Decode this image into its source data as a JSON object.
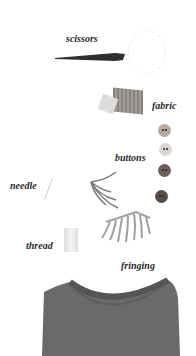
{
  "labels": {
    "scissors": "scissors",
    "fabric": "fabric",
    "buttons": "buttons",
    "needle": "needle",
    "thread": "thread",
    "fringing": "fringing"
  },
  "buttons": [
    {
      "color": "#b8a89e"
    },
    {
      "color": "#ddd6d0"
    },
    {
      "color": "#6e5f5a"
    },
    {
      "color": "#5a4d48"
    }
  ],
  "colors": {
    "tshirt": "#6a6a6a",
    "scissors_blade": "#2e2e2e",
    "fabric": "#8a8480",
    "fringe": "#9a9a9a"
  }
}
